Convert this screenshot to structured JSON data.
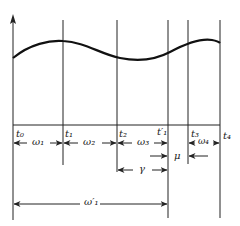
{
  "diagram": {
    "type": "timing-diagram",
    "waveform": "smooth sinusoid-like curve above baseline",
    "time_marks": [
      {
        "id": "t0",
        "label": "t₀",
        "x": 13
      },
      {
        "id": "t1",
        "label": "t₁",
        "x": 63
      },
      {
        "id": "t2",
        "label": "t₂",
        "x": 117
      },
      {
        "id": "t1p",
        "label": "t′₁",
        "x": 168
      },
      {
        "id": "t3",
        "label": "t₃",
        "x": 188
      },
      {
        "id": "t4",
        "label": "t₄",
        "x": 220
      }
    ],
    "intervals": [
      {
        "id": "omega1",
        "label": "ω₁",
        "from": "t0",
        "to": "t1"
      },
      {
        "id": "omega2",
        "label": "ω₂",
        "from": "t1",
        "to": "t2"
      },
      {
        "id": "omega3",
        "label": "ω₃",
        "from": "t2",
        "to": "t1p"
      },
      {
        "id": "omega4",
        "label": "ω₄",
        "from": "t3",
        "to": "t4"
      },
      {
        "id": "mu",
        "label": "μ",
        "from": "t1p",
        "to": "t3",
        "style": "outside-arrows"
      },
      {
        "id": "gamma",
        "label": "γ",
        "from": "t2",
        "to": "t1p"
      },
      {
        "id": "omega1p",
        "label": "ω′₁",
        "from": "t0",
        "to": "t1p"
      }
    ]
  }
}
